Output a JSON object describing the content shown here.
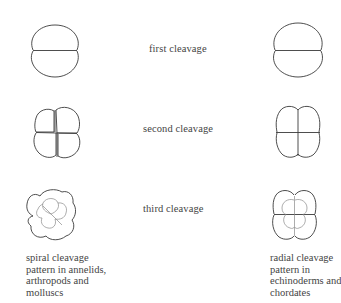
{
  "diagram": {
    "stages": [
      {
        "label": "first cleavage"
      },
      {
        "label": "second cleavage"
      },
      {
        "label": "third cleavage"
      }
    ],
    "columns": {
      "left": {
        "type": "spiral",
        "caption": [
          "spiral cleavage",
          "pattern in annelids,",
          "arthropods and",
          "molluscs"
        ]
      },
      "right": {
        "type": "radial",
        "caption": [
          "radial cleavage",
          "pattern in",
          "echinoderms and",
          "chordates"
        ]
      }
    },
    "colors": {
      "outline": "#3a3a3a",
      "inner_outline": "#7a7a7a",
      "text": "#444444",
      "background": "#ffffff"
    }
  }
}
